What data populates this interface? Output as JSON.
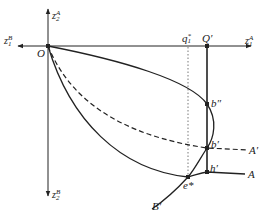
{
  "diagram": {
    "axes": {
      "z1A": {
        "base": "z",
        "sub": "1",
        "sup": "A"
      },
      "z1B": {
        "base": "z",
        "sub": "1",
        "sup": "B"
      },
      "z2A": {
        "base": "z",
        "sub": "2",
        "sup": "A"
      },
      "z2B": {
        "base": "z",
        "sub": "2",
        "sup": "B"
      }
    },
    "points": {
      "origin": "O",
      "q1star": {
        "base": "q",
        "sub": "1",
        "sup": "*"
      },
      "Qprime": "Q′",
      "b_double_prime": "b″",
      "b_prime": "b′",
      "h_prime": "h′",
      "e_star": "e*",
      "A_prime": "A′",
      "A": "A",
      "B_prime": "B′"
    },
    "colors": {
      "line": "#222222",
      "dotted": "#555555"
    }
  }
}
